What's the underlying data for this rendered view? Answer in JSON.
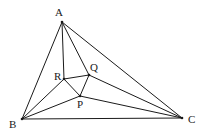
{
  "diagram": {
    "title": "",
    "points": {
      "A": {
        "label": "A",
        "x": 62,
        "y": 22,
        "lx": 55,
        "ly": 16
      },
      "B": {
        "label": "B",
        "x": 22,
        "y": 119,
        "lx": 9,
        "ly": 128
      },
      "C": {
        "label": "C",
        "x": 182,
        "y": 118,
        "lx": 188,
        "ly": 123
      },
      "R": {
        "label": "R",
        "x": 64,
        "y": 79,
        "lx": 54,
        "ly": 80
      },
      "Q": {
        "label": "Q",
        "x": 89,
        "y": 75,
        "lx": 90,
        "ly": 71
      },
      "P": {
        "label": "P",
        "x": 80,
        "y": 96,
        "lx": 77,
        "ly": 108
      }
    },
    "segments": [
      [
        "A",
        "B"
      ],
      [
        "A",
        "C"
      ],
      [
        "B",
        "C"
      ],
      [
        "A",
        "R"
      ],
      [
        "A",
        "Q"
      ],
      [
        "B",
        "R"
      ],
      [
        "B",
        "P"
      ],
      [
        "C",
        "Q"
      ],
      [
        "C",
        "P"
      ],
      [
        "R",
        "Q"
      ],
      [
        "R",
        "P"
      ],
      [
        "Q",
        "P"
      ]
    ],
    "line_color": "#1a1a1a"
  }
}
